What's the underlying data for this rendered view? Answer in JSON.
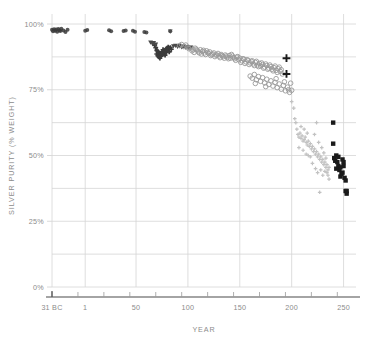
{
  "chart_data": {
    "type": "scatter",
    "title": "",
    "xlabel": "YEAR",
    "ylabel": "SILVER PURITY (% WEIGHT)",
    "xlim": [
      -31,
      262
    ],
    "ylim": [
      0,
      100
    ],
    "grid": true,
    "legend": "none",
    "x_ticks": [
      {
        "value": -31,
        "label": "31 BC"
      },
      {
        "value": 1,
        "label": "1"
      },
      {
        "value": 50,
        "label": "50"
      },
      {
        "value": 100,
        "label": "100"
      },
      {
        "value": 150,
        "label": "150"
      },
      {
        "value": 200,
        "label": "200"
      },
      {
        "value": 250,
        "label": "250"
      }
    ],
    "x_minor_ticks": [
      -31,
      -6,
      19,
      44,
      69,
      94,
      119,
      144,
      169,
      194,
      219,
      244
    ],
    "y_ticks": [
      {
        "value": 0,
        "label": "0%"
      },
      {
        "value": 25,
        "label": "25%"
      },
      {
        "value": 50,
        "label": "50%"
      },
      {
        "value": 75,
        "label": "75%"
      },
      {
        "value": 100,
        "label": "100%"
      }
    ],
    "y_gridlines": [
      0,
      12.5,
      25,
      37.5,
      50,
      62.5,
      75,
      87.5,
      100
    ],
    "colors": {
      "grid": "#d6d6d6",
      "axis": "#4a4a4a",
      "text": "#8b8b8b",
      "dark_marker": "#3a3a3a",
      "open_circle": "#9a9a9a",
      "light_marker": "#c2c2c2",
      "black_marker": "#1a1a1a"
    },
    "series": [
      {
        "name": "early-denarius-dark",
        "marker": "dark-blob",
        "color": "#3a3a3a",
        "points": [
          [
            -31,
            97.8
          ],
          [
            -30,
            97.2
          ],
          [
            -29,
            98.0
          ],
          [
            -28,
            97.4
          ],
          [
            -27,
            97.9
          ],
          [
            -26,
            97.1
          ],
          [
            -25,
            98.1
          ],
          [
            -24,
            97.6
          ],
          [
            -23,
            97.3
          ],
          [
            -22,
            98.2
          ],
          [
            -20,
            97.5
          ],
          [
            -18,
            97.0
          ],
          [
            -16,
            97.8
          ],
          [
            1,
            97.4
          ],
          [
            3,
            97.7
          ],
          [
            24,
            97.6
          ],
          [
            26,
            97.2
          ],
          [
            38,
            97.3
          ],
          [
            40,
            97.5
          ],
          [
            47,
            97.4
          ],
          [
            49,
            97.1
          ],
          [
            58,
            97.0
          ],
          [
            60,
            96.8
          ],
          [
            83,
            97.2
          ]
        ]
      },
      {
        "name": "flavian-cluster-cross",
        "marker": "plus-small",
        "color": "#3a3a3a",
        "points": [
          [
            68,
            92.0
          ],
          [
            69,
            91.0
          ],
          [
            70,
            90.0
          ],
          [
            70,
            88.6
          ],
          [
            71,
            89.5
          ],
          [
            71,
            88.0
          ],
          [
            72,
            87.5
          ],
          [
            72,
            89.0
          ],
          [
            73,
            88.2
          ],
          [
            73,
            87.0
          ],
          [
            74,
            88.8
          ],
          [
            74,
            87.8
          ],
          [
            75,
            89.4
          ],
          [
            75,
            88.4
          ],
          [
            76,
            90.2
          ],
          [
            76,
            89.0
          ],
          [
            77,
            88.6
          ],
          [
            77,
            90.0
          ],
          [
            78,
            89.6
          ],
          [
            78,
            88.2
          ],
          [
            79,
            90.4
          ],
          [
            79,
            89.2
          ],
          [
            80,
            90.8
          ],
          [
            80,
            89.8
          ],
          [
            81,
            91.2
          ],
          [
            81,
            90.2
          ],
          [
            82,
            90.6
          ],
          [
            82,
            89.4
          ],
          [
            83,
            91.0
          ],
          [
            84,
            90.4
          ]
        ]
      },
      {
        "name": "trajanic-triangles",
        "marker": "triangle",
        "color": "#4a4a4a",
        "points": [
          [
            64,
            93.0
          ],
          [
            66,
            92.4
          ],
          [
            67,
            92.8
          ],
          [
            69,
            92.2
          ],
          [
            83,
            97.2
          ],
          [
            86,
            91.6
          ],
          [
            88,
            91.8
          ],
          [
            90,
            91.4
          ],
          [
            92,
            91.7
          ],
          [
            94,
            91.2
          ],
          [
            96,
            91.5
          ],
          [
            98,
            91.0
          ],
          [
            100,
            91.3
          ],
          [
            101,
            90.8
          ],
          [
            103,
            91.1
          ]
        ]
      },
      {
        "name": "main-open-circles",
        "marker": "circle-open",
        "color": "#9a9a9a",
        "points": [
          [
            92,
            91.8
          ],
          [
            94,
            92.2
          ],
          [
            96,
            91.4
          ],
          [
            98,
            92.0
          ],
          [
            100,
            91.2
          ],
          [
            101,
            90.6
          ],
          [
            103,
            91.0
          ],
          [
            105,
            90.2
          ],
          [
            107,
            90.8
          ],
          [
            109,
            90.0
          ],
          [
            110,
            89.4
          ],
          [
            112,
            90.2
          ],
          [
            114,
            89.6
          ],
          [
            116,
            89.0
          ],
          [
            118,
            89.8
          ],
          [
            120,
            88.8
          ],
          [
            121,
            89.4
          ],
          [
            123,
            88.4
          ],
          [
            125,
            89.0
          ],
          [
            127,
            88.2
          ],
          [
            129,
            88.8
          ],
          [
            130,
            87.8
          ],
          [
            132,
            88.4
          ],
          [
            134,
            87.6
          ],
          [
            136,
            88.2
          ],
          [
            138,
            87.4
          ],
          [
            140,
            88.0
          ],
          [
            141,
            87.0
          ],
          [
            143,
            87.8
          ],
          [
            145,
            86.8
          ],
          [
            147,
            87.4
          ],
          [
            149,
            86.4
          ],
          [
            150,
            87.0
          ],
          [
            152,
            86.0
          ],
          [
            154,
            86.6
          ],
          [
            156,
            85.6
          ],
          [
            158,
            86.2
          ],
          [
            160,
            85.2
          ],
          [
            161,
            85.8
          ],
          [
            163,
            84.8
          ],
          [
            165,
            85.4
          ],
          [
            167,
            84.4
          ],
          [
            169,
            85.0
          ],
          [
            170,
            84.0
          ],
          [
            172,
            84.6
          ],
          [
            174,
            83.6
          ],
          [
            176,
            84.2
          ],
          [
            178,
            83.2
          ],
          [
            180,
            83.8
          ],
          [
            181,
            82.8
          ],
          [
            183,
            83.4
          ],
          [
            185,
            82.4
          ],
          [
            187,
            83.0
          ],
          [
            189,
            82.0
          ],
          [
            190,
            82.6
          ],
          [
            104,
            89.8
          ],
          [
            106,
            89.2
          ],
          [
            108,
            90.4
          ],
          [
            111,
            89.0
          ],
          [
            113,
            88.6
          ],
          [
            115,
            90.0
          ],
          [
            117,
            88.4
          ],
          [
            119,
            89.2
          ],
          [
            122,
            88.0
          ],
          [
            124,
            88.6
          ],
          [
            126,
            87.6
          ],
          [
            128,
            88.2
          ],
          [
            131,
            87.2
          ],
          [
            133,
            88.0
          ],
          [
            135,
            87.0
          ],
          [
            137,
            87.8
          ],
          [
            139,
            86.8
          ],
          [
            142,
            88.4
          ],
          [
            144,
            87.2
          ],
          [
            146,
            86.2
          ],
          [
            148,
            87.6
          ],
          [
            151,
            85.4
          ],
          [
            153,
            86.8
          ],
          [
            155,
            85.0
          ],
          [
            157,
            86.4
          ],
          [
            159,
            84.6
          ],
          [
            162,
            86.0
          ],
          [
            164,
            84.2
          ],
          [
            166,
            85.8
          ],
          [
            168,
            83.8
          ],
          [
            171,
            85.2
          ],
          [
            173,
            83.2
          ],
          [
            175,
            84.8
          ],
          [
            177,
            82.8
          ],
          [
            179,
            84.4
          ],
          [
            182,
            82.2
          ],
          [
            184,
            84.0
          ],
          [
            186,
            81.6
          ],
          [
            188,
            83.6
          ],
          [
            191,
            81.0
          ],
          [
            160,
            80.2
          ],
          [
            162,
            79.4
          ],
          [
            164,
            80.8
          ],
          [
            166,
            78.8
          ],
          [
            168,
            80.0
          ],
          [
            170,
            78.2
          ],
          [
            172,
            79.6
          ],
          [
            174,
            77.6
          ],
          [
            176,
            79.0
          ],
          [
            178,
            77.0
          ],
          [
            180,
            78.4
          ],
          [
            182,
            76.4
          ],
          [
            184,
            77.8
          ],
          [
            186,
            75.8
          ],
          [
            188,
            77.2
          ],
          [
            190,
            75.2
          ],
          [
            192,
            76.6
          ],
          [
            194,
            74.6
          ],
          [
            196,
            76.0
          ],
          [
            198,
            74.0
          ],
          [
            165,
            77.4
          ],
          [
            175,
            76.2
          ],
          [
            185,
            79.2
          ],
          [
            193,
            78.0
          ],
          [
            197,
            75.0
          ],
          [
            199,
            77.5
          ],
          [
            200,
            74.8
          ]
        ]
      },
      {
        "name": "severan-plus-black",
        "marker": "plus-large",
        "color": "#1a1a1a",
        "points": [
          [
            195,
            87.0
          ],
          [
            195,
            81.0
          ]
        ]
      },
      {
        "name": "third-century-light",
        "marker": "dot-light",
        "color": "#c2c2c2",
        "points": [
          [
            200,
            70.5
          ],
          [
            202,
            68.0
          ],
          [
            203,
            64.0
          ],
          [
            204,
            62.5
          ],
          [
            205,
            60.0
          ],
          [
            206,
            58.0
          ],
          [
            207,
            57.0
          ],
          [
            208,
            58.5
          ],
          [
            209,
            56.5
          ],
          [
            210,
            57.5
          ],
          [
            211,
            55.5
          ],
          [
            212,
            56.0
          ],
          [
            213,
            57.0
          ],
          [
            214,
            55.0
          ],
          [
            215,
            54.0
          ],
          [
            216,
            55.5
          ],
          [
            217,
            53.5
          ],
          [
            218,
            54.5
          ],
          [
            219,
            52.5
          ],
          [
            220,
            53.5
          ],
          [
            221,
            51.5
          ],
          [
            222,
            52.5
          ],
          [
            223,
            50.5
          ],
          [
            224,
            51.5
          ],
          [
            225,
            49.5
          ],
          [
            226,
            50.5
          ],
          [
            227,
            48.5
          ],
          [
            228,
            49.5
          ],
          [
            229,
            47.5
          ],
          [
            230,
            48.5
          ],
          [
            231,
            46.5
          ],
          [
            232,
            47.5
          ],
          [
            233,
            45.5
          ],
          [
            234,
            46.5
          ],
          [
            235,
            44.5
          ],
          [
            236,
            45.5
          ],
          [
            224,
            62.5
          ],
          [
            222,
            58.0
          ],
          [
            226,
            55.0
          ],
          [
            229,
            53.0
          ],
          [
            231,
            51.0
          ],
          [
            233,
            49.0
          ],
          [
            234,
            43.5
          ],
          [
            235,
            42.5
          ],
          [
            236,
            41.0
          ],
          [
            227,
            36.0
          ],
          [
            218,
            49.5
          ],
          [
            215,
            58.5
          ],
          [
            212,
            60.0
          ],
          [
            209,
            61.0
          ],
          [
            207,
            53.0
          ],
          [
            211,
            52.0
          ],
          [
            214,
            50.5
          ],
          [
            216,
            50.0
          ],
          [
            220,
            47.0
          ],
          [
            223,
            45.0
          ],
          [
            225,
            43.5
          ],
          [
            228,
            44.5
          ],
          [
            230,
            42.5
          ],
          [
            232,
            44.0
          ]
        ]
      },
      {
        "name": "late-black-squares",
        "marker": "square-filled",
        "color": "#1a1a1a",
        "points": [
          [
            240,
            62.5
          ],
          [
            240,
            54.5
          ],
          [
            241,
            49.0
          ],
          [
            242,
            48.0
          ],
          [
            243,
            50.0
          ],
          [
            244,
            47.5
          ],
          [
            245,
            46.0
          ],
          [
            246,
            44.5
          ],
          [
            247,
            45.5
          ],
          [
            248,
            43.0
          ],
          [
            249,
            48.5
          ],
          [
            250,
            47.5
          ],
          [
            250,
            46.0
          ],
          [
            251,
            41.5
          ],
          [
            252,
            40.5
          ],
          [
            252,
            36.5
          ],
          [
            253,
            35.5
          ],
          [
            253,
            36.5
          ],
          [
            249,
            43.5
          ],
          [
            247,
            42.0
          ],
          [
            245,
            49.5
          ],
          [
            243,
            45.0
          ]
        ]
      }
    ]
  }
}
